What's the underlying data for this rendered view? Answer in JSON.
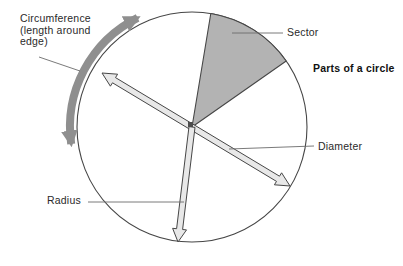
{
  "title": "Parts of a circle",
  "labels": {
    "circumference": {
      "line1": "Circumference",
      "line2": "(length around",
      "line3": "edge)"
    },
    "sector": "Sector",
    "diameter": "Diameter",
    "radius": "Radius"
  },
  "colors": {
    "background": "#ffffff",
    "sector_fill": "#b3b3b3",
    "circumference_arrow": "#8f8f8f",
    "block_arrow_fill": "#e8e8e8",
    "outline": "#464646",
    "leader_line": "#6b6b6b",
    "text": "#2a2a2a"
  }
}
